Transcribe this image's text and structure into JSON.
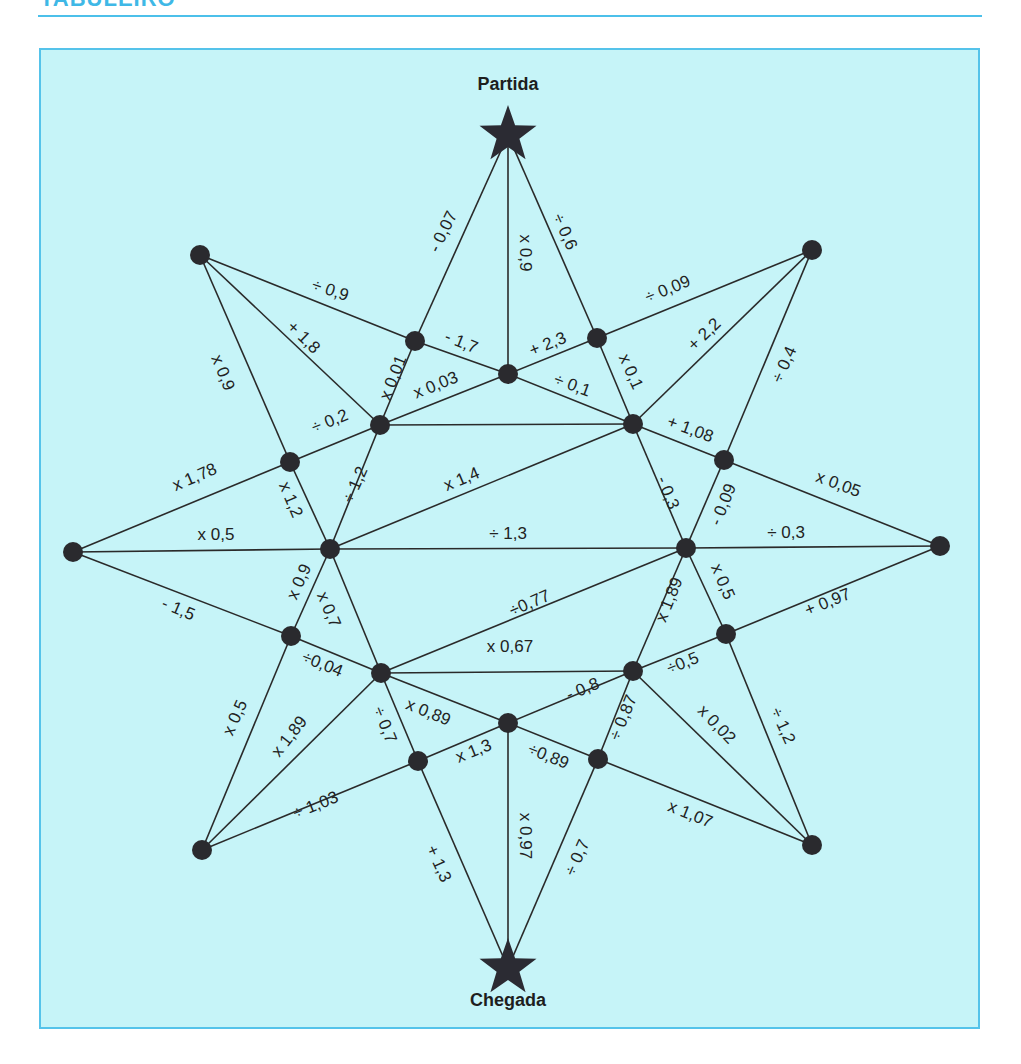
{
  "header": {
    "title": "TABULEIRO"
  },
  "colors": {
    "accent": "#4cc0ea",
    "board_bg": "#c6f4f8",
    "ink": "#2a2a2a"
  },
  "board": {
    "start_label": "Partida",
    "end_label": "Chegada",
    "nodes": {
      "start": [
        508,
        135
      ],
      "end": [
        508,
        968
      ],
      "tl": [
        200,
        255
      ],
      "tr": [
        812,
        250
      ],
      "l": [
        73,
        552
      ],
      "r": [
        940,
        546
      ],
      "bl": [
        202,
        850
      ],
      "br": [
        812,
        845
      ],
      "p": [
        415,
        341
      ],
      "q": [
        508,
        374
      ],
      "s": [
        597,
        338
      ],
      "a": [
        380,
        425
      ],
      "b": [
        633,
        424
      ],
      "c": [
        290,
        462
      ],
      "d": [
        724,
        460
      ],
      "e": [
        330,
        549
      ],
      "f": [
        686,
        548
      ],
      "g": [
        291,
        636
      ],
      "h": [
        726,
        634
      ],
      "i": [
        381,
        673
      ],
      "j": [
        633,
        671
      ],
      "k": [
        418,
        761
      ],
      "m": [
        508,
        723
      ],
      "n": [
        598,
        759
      ]
    },
    "edges": [
      {
        "from": "start",
        "to": "p",
        "label": "- 0,07",
        "lx": 444,
        "ly": 232,
        "rot": -64
      },
      {
        "from": "start",
        "to": "q",
        "label": "x 0,9",
        "lx": 524,
        "ly": 253,
        "rot": 90
      },
      {
        "from": "start",
        "to": "s",
        "label": "÷ 0,6",
        "lx": 564,
        "ly": 232,
        "rot": 66
      },
      {
        "from": "tl",
        "to": "p",
        "label": "÷ 0,9",
        "lx": 330,
        "ly": 291,
        "rot": 18
      },
      {
        "from": "tl",
        "to": "a",
        "label": "+ 1,8",
        "lx": 303,
        "ly": 338,
        "rot": 44
      },
      {
        "from": "tl",
        "to": "c",
        "label": "x 0,9",
        "lx": 222,
        "ly": 373,
        "rot": 68
      },
      {
        "from": "p",
        "to": "q",
        "label": "- 1,7",
        "lx": 461,
        "ly": 343,
        "rot": 22
      },
      {
        "from": "p",
        "to": "a",
        "label": "x 0,01",
        "lx": 394,
        "ly": 378,
        "rot": -68
      },
      {
        "from": "a",
        "to": "q",
        "label": "x 0,03",
        "lx": 436,
        "ly": 386,
        "rot": -22
      },
      {
        "from": "q",
        "to": "s",
        "label": "+ 2,3",
        "lx": 548,
        "ly": 345,
        "rot": -22
      },
      {
        "from": "q",
        "to": "b",
        "label": "÷ 0,1",
        "lx": 572,
        "ly": 386,
        "rot": 20
      },
      {
        "from": "s",
        "to": "tr",
        "label": "÷ 0,09",
        "lx": 668,
        "ly": 290,
        "rot": -22
      },
      {
        "from": "s",
        "to": "b",
        "label": "x 0,1",
        "lx": 630,
        "ly": 372,
        "rot": 66
      },
      {
        "from": "b",
        "to": "tr",
        "label": "+ 2,2",
        "lx": 705,
        "ly": 335,
        "rot": -44
      },
      {
        "from": "tr",
        "to": "d",
        "label": "÷ 0,4",
        "lx": 785,
        "ly": 365,
        "rot": -66
      },
      {
        "from": "a",
        "to": "b",
        "label": "",
        "lx": 0,
        "ly": 0,
        "rot": 0
      },
      {
        "from": "c",
        "to": "a",
        "label": "÷ 0,2",
        "lx": 330,
        "ly": 422,
        "rot": -22
      },
      {
        "from": "b",
        "to": "d",
        "label": "+ 1,08",
        "lx": 690,
        "ly": 430,
        "rot": 20
      },
      {
        "from": "l",
        "to": "c",
        "label": "x 1,78",
        "lx": 195,
        "ly": 478,
        "rot": -23
      },
      {
        "from": "c",
        "to": "e",
        "label": "x 1,2",
        "lx": 290,
        "ly": 500,
        "rot": 67
      },
      {
        "from": "a",
        "to": "e",
        "label": "÷ 1,2",
        "lx": 356,
        "ly": 485,
        "rot": -66
      },
      {
        "from": "e",
        "to": "b",
        "label": "x 1,4",
        "lx": 462,
        "ly": 480,
        "rot": -23
      },
      {
        "from": "b",
        "to": "f",
        "label": "- 0,3",
        "lx": 667,
        "ly": 493,
        "rot": 68
      },
      {
        "from": "d",
        "to": "f",
        "label": "- 0,09",
        "lx": 724,
        "ly": 505,
        "rot": -68
      },
      {
        "from": "d",
        "to": "r",
        "label": "x 0,05",
        "lx": 838,
        "ly": 485,
        "rot": 20
      },
      {
        "from": "l",
        "to": "e",
        "label": "x 0,5",
        "lx": 216,
        "ly": 536,
        "rot": 0
      },
      {
        "from": "e",
        "to": "f",
        "label": "÷ 1,3",
        "lx": 508,
        "ly": 535,
        "rot": 0
      },
      {
        "from": "f",
        "to": "r",
        "label": "÷ 0,3",
        "lx": 786,
        "ly": 534,
        "rot": 0
      },
      {
        "from": "l",
        "to": "g",
        "label": "- 1,5",
        "lx": 178,
        "ly": 610,
        "rot": 23
      },
      {
        "from": "e",
        "to": "g",
        "label": "x 0,9",
        "lx": 300,
        "ly": 582,
        "rot": -66
      },
      {
        "from": "e",
        "to": "i",
        "label": "x 0,7",
        "lx": 328,
        "ly": 610,
        "rot": 67
      },
      {
        "from": "i",
        "to": "f",
        "label": "÷0,77",
        "lx": 530,
        "ly": 604,
        "rot": -23
      },
      {
        "from": "f",
        "to": "j",
        "label": "x 1,89",
        "lx": 670,
        "ly": 600,
        "rot": -68
      },
      {
        "from": "f",
        "to": "h",
        "label": "x 0,5",
        "lx": 722,
        "ly": 582,
        "rot": 67
      },
      {
        "from": "h",
        "to": "r",
        "label": "+ 0,97",
        "lx": 828,
        "ly": 603,
        "rot": -22
      },
      {
        "from": "i",
        "to": "j",
        "label": "x 0,67",
        "lx": 510,
        "ly": 648,
        "rot": 0
      },
      {
        "from": "g",
        "to": "i",
        "label": "÷0,04",
        "lx": 322,
        "ly": 665,
        "rot": 22
      },
      {
        "from": "j",
        "to": "h",
        "label": "÷0,5",
        "lx": 683,
        "ly": 664,
        "rot": -22
      },
      {
        "from": "g",
        "to": "bl",
        "label": "x 0,5",
        "lx": 236,
        "ly": 718,
        "rot": -66
      },
      {
        "from": "i",
        "to": "bl",
        "label": "x 1,89",
        "lx": 290,
        "ly": 737,
        "rot": -52
      },
      {
        "from": "i",
        "to": "k",
        "label": "÷ 0,7",
        "lx": 384,
        "ly": 725,
        "rot": 68
      },
      {
        "from": "i",
        "to": "m",
        "label": "x 0,89",
        "lx": 428,
        "ly": 713,
        "rot": 22
      },
      {
        "from": "m",
        "to": "j",
        "label": "- 0,8",
        "lx": 583,
        "ly": 690,
        "rot": -22
      },
      {
        "from": "j",
        "to": "n",
        "label": "÷ 0,87",
        "lx": 624,
        "ly": 718,
        "rot": -68
      },
      {
        "from": "j",
        "to": "br",
        "label": "x 0,02",
        "lx": 716,
        "ly": 725,
        "rot": 46
      },
      {
        "from": "h",
        "to": "br",
        "label": "÷ 1,2",
        "lx": 782,
        "ly": 726,
        "rot": 66
      },
      {
        "from": "k",
        "to": "m",
        "label": "x 1,3",
        "lx": 474,
        "ly": 752,
        "rot": -22
      },
      {
        "from": "m",
        "to": "n",
        "label": "÷0,89",
        "lx": 548,
        "ly": 757,
        "rot": 22
      },
      {
        "from": "n",
        "to": "br",
        "label": "x 1,07",
        "lx": 690,
        "ly": 815,
        "rot": 22
      },
      {
        "from": "bl",
        "to": "k",
        "label": "÷ 1,03",
        "lx": 316,
        "ly": 806,
        "rot": -22
      },
      {
        "from": "k",
        "to": "end",
        "label": "+ 1,3",
        "lx": 438,
        "ly": 864,
        "rot": 66
      },
      {
        "from": "m",
        "to": "end",
        "label": "x 0,97",
        "lx": 524,
        "ly": 836,
        "rot": 90
      },
      {
        "from": "n",
        "to": "end",
        "label": "÷ 0,7",
        "lx": 578,
        "ly": 858,
        "rot": -66
      }
    ]
  }
}
